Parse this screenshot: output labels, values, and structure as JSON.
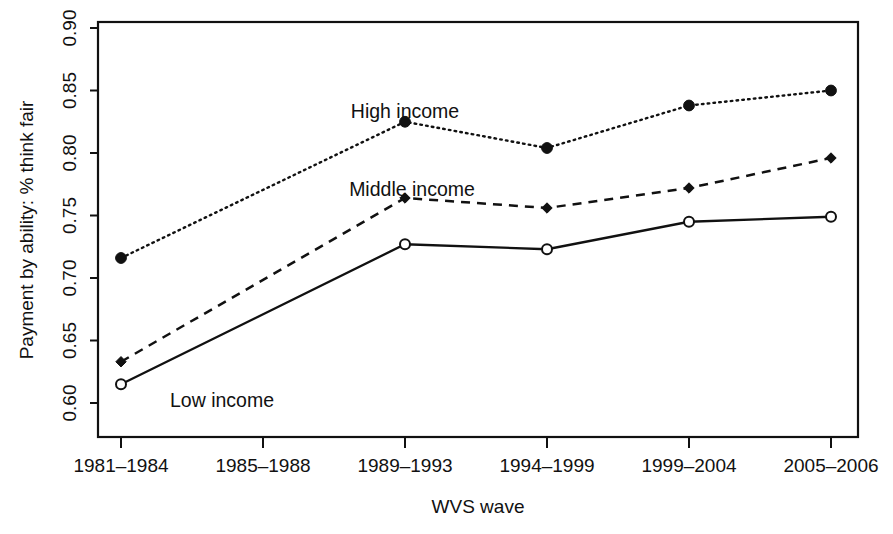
{
  "chart_data": {
    "type": "line",
    "title": "",
    "xlabel": "WVS wave",
    "ylabel": "Payment by ability: % think fair",
    "categories": [
      "1981–1984",
      "1985–1988",
      "1989–1993",
      "1994–1999",
      "1999–2004",
      "2005–2006"
    ],
    "xtick_labels": [
      "1981–1984",
      "1985–1988",
      "1989–1993",
      "1994–1999",
      "1999–2004",
      "2005–2006"
    ],
    "ytick_labels": [
      "0.60",
      "0.65",
      "0.70",
      "0.75",
      "0.80",
      "0.85",
      "0.90"
    ],
    "ytick_values": [
      0.6,
      0.65,
      0.7,
      0.75,
      0.8,
      0.85,
      0.9
    ],
    "ylim": [
      0.5865,
      0.9135
    ],
    "xlim": [
      0.5,
      6.5
    ],
    "grid": false,
    "legend": "inline-labels",
    "series": [
      {
        "name": "High income",
        "marker": "filled-circle",
        "linestyle": "dotted",
        "color": "#111111",
        "label_position": "above-point-3",
        "values": [
          0.716,
          null,
          0.825,
          0.804,
          0.838,
          0.85
        ],
        "points": [
          {
            "category": "1981–1984",
            "value": 0.716
          },
          {
            "category": "1989–1993",
            "value": 0.825
          },
          {
            "category": "1994–1999",
            "value": 0.804
          },
          {
            "category": "1999–2004",
            "value": 0.838
          },
          {
            "category": "2005–2006",
            "value": 0.85
          }
        ]
      },
      {
        "name": "Middle income",
        "marker": "filled-diamond",
        "linestyle": "dashed",
        "color": "#111111",
        "label_position": "above-point-3",
        "values": [
          0.633,
          null,
          0.764,
          0.756,
          0.772,
          0.796
        ],
        "points": [
          {
            "category": "1981–1984",
            "value": 0.633
          },
          {
            "category": "1989–1993",
            "value": 0.764
          },
          {
            "category": "1994–1999",
            "value": 0.756
          },
          {
            "category": "1999–2004",
            "value": 0.772
          },
          {
            "category": "2005–2006",
            "value": 0.796
          }
        ]
      },
      {
        "name": "Low income",
        "marker": "open-circle",
        "linestyle": "solid",
        "color": "#111111",
        "label_position": "right-of-point-1",
        "values": [
          0.615,
          null,
          0.727,
          0.723,
          0.745,
          0.749
        ],
        "points": [
          {
            "category": "1981–1984",
            "value": 0.615
          },
          {
            "category": "1989–1993",
            "value": 0.727
          },
          {
            "category": "1994–1999",
            "value": 0.723
          },
          {
            "category": "1999–2004",
            "value": 0.745
          },
          {
            "category": "2005–2006",
            "value": 0.749
          }
        ]
      }
    ]
  },
  "labels": {
    "high_income": "High income",
    "middle_income": "Middle income",
    "low_income": "Low income",
    "x_axis_title": "WVS wave",
    "y_axis_title": "Payment by ability: % think fair",
    "y_0_60": "0.60",
    "y_0_65": "0.65",
    "y_0_70": "0.70",
    "y_0_75": "0.75",
    "y_0_80": "0.80",
    "y_0_85": "0.85",
    "y_0_90": "0.90",
    "x_1": "1981–1984",
    "x_2": "1985–1988",
    "x_3": "1989–1993",
    "x_4": "1994–1999",
    "x_5": "1999–2004",
    "x_6": "2005–2006"
  }
}
